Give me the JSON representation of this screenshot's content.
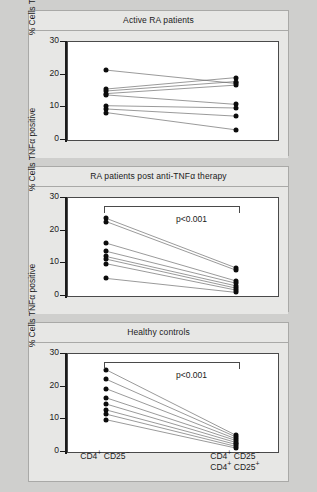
{
  "figure": {
    "background": "#cfcfcd",
    "panel_background": "#e7e7e5",
    "dot_color": "#0c0c0c",
    "line_color": "#6e6e6e"
  },
  "axis": {
    "ylabel": "% Cells TNFα positive",
    "yticks": [
      0,
      10,
      20,
      30
    ],
    "ylim": [
      0,
      30
    ],
    "ytick_labels": [
      "0",
      "10",
      "20",
      "30"
    ],
    "xcat_left_line1": "CD4",
    "xcat_left_sup1": "+",
    "xcat_left_line1b": " CD25",
    "xcat_left_sup2": "−",
    "xcat_right_line1": "CD4",
    "xcat_right_line2": "CD4",
    "x_labels": {
      "left": "CD4+ CD25−",
      "right_line_1": "CD4+ CD25−",
      "right_line_2": "CD4+ CD25+"
    }
  },
  "panels": [
    {
      "id": "active-ra",
      "title": "Active RA patients",
      "pvalue": null,
      "show_xaxis": false
    },
    {
      "id": "post-anti-tnf",
      "title": "RA patients post anti-TNFα therapy",
      "pvalue": "p<0.001",
      "show_xaxis": false
    },
    {
      "id": "healthy-controls",
      "title": "Healthy controls",
      "pvalue": "p<0.001",
      "show_xaxis": true
    }
  ],
  "chart_data": {
    "type": "line",
    "xlabel": "",
    "ylabel": "% Cells TNFα positive",
    "ylim": [
      0,
      30
    ],
    "yticks": [
      0,
      10,
      20,
      30
    ],
    "x": [
      "CD4+ CD25−",
      "CD4+ CD25− / CD4+ CD25+"
    ],
    "grid": false,
    "legend": "none",
    "panels": [
      {
        "name": "Active RA patients",
        "annotation": null,
        "pairs": [
          {
            "left": 21.4,
            "right": 17.3
          },
          {
            "left": 15.6,
            "right": 19.1
          },
          {
            "left": 15.0,
            "right": 17.9
          },
          {
            "left": 14.2,
            "right": 16.8
          },
          {
            "left": 13.8,
            "right": 10.9
          },
          {
            "left": 10.5,
            "right": 9.8
          },
          {
            "left": 9.5,
            "right": 7.3
          },
          {
            "left": 8.4,
            "right": 3.1
          }
        ]
      },
      {
        "name": "RA patients post anti-TNFα therapy",
        "annotation": "p<0.001",
        "pairs": [
          {
            "left": 23.8,
            "right": 8.6
          },
          {
            "left": 22.8,
            "right": 7.9
          },
          {
            "left": 16.2,
            "right": 4.6
          },
          {
            "left": 13.7,
            "right": 3.9
          },
          {
            "left": 12.1,
            "right": 3.1
          },
          {
            "left": 11.3,
            "right": 2.4
          },
          {
            "left": 9.9,
            "right": 1.8
          },
          {
            "left": 5.4,
            "right": 1.1
          }
        ]
      },
      {
        "name": "Healthy controls",
        "annotation": "p<0.001",
        "pairs": [
          {
            "left": 25.2,
            "right": 5.1
          },
          {
            "left": 22.3,
            "right": 4.6
          },
          {
            "left": 19.4,
            "right": 4.0
          },
          {
            "left": 16.6,
            "right": 3.5
          },
          {
            "left": 14.7,
            "right": 2.9
          },
          {
            "left": 12.9,
            "right": 2.3
          },
          {
            "left": 11.6,
            "right": 1.7
          },
          {
            "left": 9.9,
            "right": 1.2
          }
        ]
      }
    ]
  }
}
